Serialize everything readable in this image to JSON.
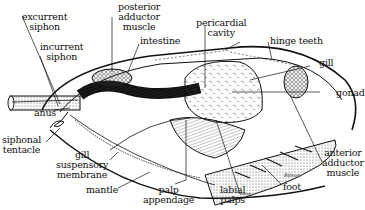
{
  "figure": {
    "labels": [
      {
        "id": "excurrent-siphon",
        "text": "excurrent\nsiphon"
      },
      {
        "id": "incurrent-siphon",
        "text": "incurrent\nsiphon"
      },
      {
        "id": "posterior-adductor-muscle",
        "text": "posterior\nadductor\nmuscle"
      },
      {
        "id": "intestine",
        "text": "intestine"
      },
      {
        "id": "pericardial-cavity",
        "text": "pericardial\ncavity"
      },
      {
        "id": "hinge-teeth",
        "text": "hinge teeth"
      },
      {
        "id": "gill",
        "text": "gill"
      },
      {
        "id": "gonad",
        "text": "gonad"
      },
      {
        "id": "anus",
        "text": "anus"
      },
      {
        "id": "siphonal-tentacle",
        "text": "siphonal\ntentacle"
      },
      {
        "id": "gill-suspensory-membrane",
        "text": "gill\nsuspensory\nmembrane"
      },
      {
        "id": "mantle",
        "text": "mantle"
      },
      {
        "id": "palp-appendage",
        "text": "palp\nappendage"
      },
      {
        "id": "labial-palps",
        "text": "labial\npalps"
      },
      {
        "id": "foot",
        "text": "foot"
      },
      {
        "id": "anterior-adductor-muscle",
        "text": "anterior\nadductor\nmuscle"
      }
    ],
    "signature": "Ritson"
  }
}
